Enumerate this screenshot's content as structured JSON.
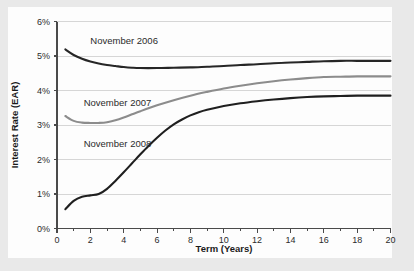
{
  "chart_data": {
    "type": "line",
    "title": "",
    "xlabel": "Term (Years)",
    "ylabel": "Interest Rate (EAR)",
    "xlim": [
      0,
      20
    ],
    "ylim": [
      0,
      6
    ],
    "x_ticks": [
      0,
      2,
      4,
      6,
      8,
      10,
      12,
      14,
      16,
      18,
      20
    ],
    "x_tick_labels": [
      "0",
      "2",
      "4",
      "6",
      "8",
      "10",
      "12",
      "14",
      "16",
      "18",
      "20"
    ],
    "x_minor_ticks": [
      1,
      3,
      5,
      7,
      9,
      11,
      13,
      15,
      17,
      19
    ],
    "y_ticks": [
      0,
      1,
      2,
      3,
      4,
      5,
      6
    ],
    "y_tick_labels": [
      "0%",
      "1%",
      "2%",
      "3%",
      "4%",
      "5%",
      "6%"
    ],
    "grid": "horizontal",
    "legend_position": "inline-annotations",
    "series": [
      {
        "name": "November 2006",
        "color": "#262626",
        "label_x": 2.0,
        "label_y": 5.45,
        "x": [
          0.5,
          1,
          1.5,
          2,
          2.5,
          3,
          3.5,
          4,
          4.5,
          5,
          6,
          7,
          8,
          9,
          10,
          11,
          12,
          13,
          14,
          15,
          16,
          17,
          18,
          19,
          20
        ],
        "y": [
          5.19,
          5.03,
          4.92,
          4.84,
          4.78,
          4.74,
          4.71,
          4.68,
          4.66,
          4.65,
          4.65,
          4.66,
          4.67,
          4.69,
          4.71,
          4.74,
          4.76,
          4.79,
          4.81,
          4.83,
          4.85,
          4.86,
          4.86,
          4.86,
          4.86
        ]
      },
      {
        "name": "November 2007",
        "color": "#8c8c8c",
        "label_x": 1.6,
        "label_y": 3.66,
        "x": [
          0.5,
          1,
          1.5,
          2,
          2.5,
          3,
          3.5,
          4,
          4.5,
          5,
          6,
          7,
          8,
          9,
          10,
          11,
          12,
          13,
          14,
          15,
          16,
          17,
          18,
          19,
          20
        ],
        "y": [
          3.26,
          3.12,
          3.07,
          3.06,
          3.06,
          3.08,
          3.14,
          3.22,
          3.31,
          3.4,
          3.57,
          3.72,
          3.85,
          3.96,
          4.06,
          4.14,
          4.21,
          4.27,
          4.32,
          4.36,
          4.39,
          4.4,
          4.41,
          4.41,
          4.41
        ]
      },
      {
        "name": "November 2008",
        "color": "#1f1f1f",
        "label_x": 1.6,
        "label_y": 2.46,
        "x": [
          0.5,
          1,
          1.5,
          2,
          2.5,
          3,
          3.5,
          4,
          4.5,
          5,
          5.5,
          6,
          6.5,
          7,
          7.5,
          8,
          8.5,
          9,
          10,
          11,
          12,
          13,
          14,
          15,
          16,
          17,
          18,
          19,
          20
        ],
        "y": [
          0.56,
          0.8,
          0.92,
          0.96,
          1.0,
          1.15,
          1.38,
          1.63,
          1.89,
          2.15,
          2.4,
          2.63,
          2.84,
          3.02,
          3.16,
          3.28,
          3.37,
          3.44,
          3.55,
          3.63,
          3.69,
          3.74,
          3.78,
          3.81,
          3.83,
          3.84,
          3.85,
          3.85,
          3.85
        ]
      }
    ]
  },
  "colors": {
    "page_background": "#e9e9e9",
    "card_background": "#fdfdfd",
    "gridline": "#d6d6d6",
    "axis": "#4a4a4a",
    "text": "#2b2b2b"
  }
}
